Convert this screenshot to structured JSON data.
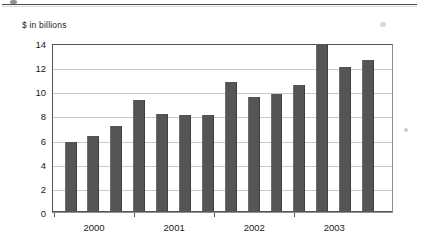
{
  "page": {
    "top_rule": "horizontal-rule",
    "background": "#ffffff"
  },
  "chart_data": {
    "type": "bar",
    "title": "",
    "subtitle": "",
    "ylabel": "$ in billions",
    "xlabel": "",
    "ylim": [
      0,
      14
    ],
    "ytick_values": [
      0,
      2,
      4,
      6,
      8,
      10,
      12,
      14
    ],
    "ytick_labels": [
      "0",
      "2",
      "4",
      "6",
      "8",
      "10",
      "12",
      "14"
    ],
    "grid": true,
    "legend": "none",
    "bar_color": "#555555",
    "categories": [
      "2000 Q1",
      "2000 Q2",
      "2000 Q3",
      "2000 Q4",
      "2001 Q1",
      "2001 Q2",
      "2001 Q3",
      "2001 Q4",
      "2002 Q1",
      "2002 Q2",
      "2002 Q3",
      "2002 Q4",
      "2003 Q1",
      "2003 Q2",
      "2003 Q3",
      "2003 Q4"
    ],
    "values": [
      5.8,
      6.3,
      7.1,
      9.3,
      8.1,
      8.0,
      8.0,
      10.8,
      9.5,
      9.8,
      10.5,
      13.9,
      12.0,
      12.6,
      0,
      0
    ],
    "xaxis_group_labels": [
      "2000",
      "2001",
      "2002",
      "2003"
    ],
    "bar_count": 14
  },
  "axis": {
    "y_title": "$ in billions"
  }
}
